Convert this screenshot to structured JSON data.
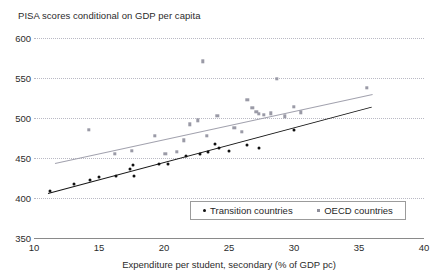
{
  "chart_data": {
    "type": "scatter",
    "title": "PISA scores conditional on GDP per capita",
    "xlabel": "Expenditure per student, secondary (% of GDP pc)",
    "ylabel": "",
    "xlim": [
      10,
      40
    ],
    "ylim": [
      350,
      600
    ],
    "xticks": [
      10,
      15,
      20,
      25,
      30,
      35,
      40
    ],
    "yticks": [
      350,
      400,
      450,
      500,
      550,
      600
    ],
    "grid": "horizontal-dotted",
    "legend_position": "bottom-center",
    "series": [
      {
        "name": "Transition countries",
        "marker": "dot",
        "color": "#111111",
        "points": [
          [
            11.2,
            409
          ],
          [
            13.1,
            417
          ],
          [
            14.3,
            422
          ],
          [
            15.0,
            426
          ],
          [
            16.3,
            428
          ],
          [
            17.4,
            436
          ],
          [
            17.6,
            441
          ],
          [
            17.7,
            428
          ],
          [
            19.6,
            443
          ],
          [
            20.3,
            443
          ],
          [
            21.7,
            452
          ],
          [
            22.8,
            455
          ],
          [
            23.4,
            457
          ],
          [
            23.9,
            468
          ],
          [
            24.2,
            462
          ],
          [
            25.0,
            459
          ],
          [
            26.4,
            466
          ],
          [
            27.3,
            463
          ],
          [
            30.0,
            485
          ]
        ],
        "fit_line": {
          "x0": 11.1,
          "y0": 406,
          "x1": 36.0,
          "y1": 514
        }
      },
      {
        "name": "OECD countries",
        "marker": "square",
        "color": "#9a9aa6",
        "points": [
          [
            14.2,
            485
          ],
          [
            16.2,
            455
          ],
          [
            17.5,
            459
          ],
          [
            19.3,
            478
          ],
          [
            20.1,
            455
          ],
          [
            21.0,
            458
          ],
          [
            21.5,
            472
          ],
          [
            22.0,
            492
          ],
          [
            22.6,
            497
          ],
          [
            23.0,
            571
          ],
          [
            23.3,
            478
          ],
          [
            24.1,
            503
          ],
          [
            25.4,
            488
          ],
          [
            26.0,
            483
          ],
          [
            26.4,
            523
          ],
          [
            26.8,
            513
          ],
          [
            27.1,
            508
          ],
          [
            27.3,
            505
          ],
          [
            27.7,
            504
          ],
          [
            28.2,
            506
          ],
          [
            28.7,
            549
          ],
          [
            29.3,
            502
          ],
          [
            30.0,
            514
          ],
          [
            30.5,
            507
          ],
          [
            35.6,
            538
          ]
        ],
        "fit_line": {
          "x0": 11.6,
          "y0": 444,
          "x1": 36.0,
          "y1": 530
        }
      }
    ]
  },
  "legend": {
    "items": [
      {
        "label": "Transition countries",
        "marker": "dot"
      },
      {
        "label": "OECD countries",
        "marker": "square"
      }
    ]
  }
}
